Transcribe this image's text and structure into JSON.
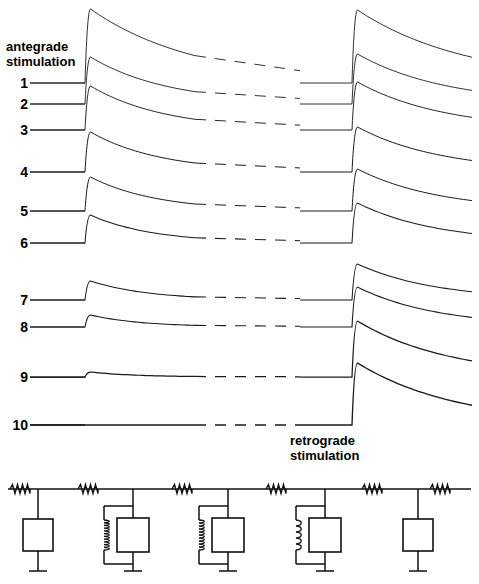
{
  "figure": {
    "kind": "electrophysiology-recording-with-equivalent-circuit",
    "antegrade_label": "antegrade\nstimulation",
    "retrograde_label": "retrograde\nstimulation"
  },
  "chart_data": {
    "type": "line",
    "title": "",
    "xlabel": "",
    "ylabel": "",
    "grid": false,
    "legend": null,
    "annotations": [
      "antegrade stimulation",
      "retrograde stimulation"
    ],
    "x_axis": {
      "antegrade_stimulus_x": 85,
      "retrograde_stimulus_x": 352,
      "time_break_dashes": [
        195,
        300
      ],
      "trace_start_x": 30,
      "trace_end_x": 472
    },
    "categories": [
      "1",
      "2",
      "3",
      "4",
      "5",
      "6",
      "7",
      "8",
      "9",
      "10"
    ],
    "series": [
      {
        "name": "1",
        "baseline_y": 83,
        "antegrade_amplitude": 74,
        "retrograde_amplitude": 73,
        "antegrade_decay": 105,
        "retrograde_decay": 110,
        "stroke_width": 0.9
      },
      {
        "name": "2",
        "baseline_y": 104,
        "antegrade_amplitude": 47,
        "retrograde_amplitude": 50,
        "antegrade_decay": 78,
        "retrograde_decay": 88,
        "stroke_width": 0.9
      },
      {
        "name": "3",
        "baseline_y": 130,
        "antegrade_amplitude": 44,
        "retrograde_amplitude": 48,
        "antegrade_decay": 74,
        "retrograde_decay": 86,
        "stroke_width": 0.95
      },
      {
        "name": "4",
        "baseline_y": 172,
        "antegrade_amplitude": 40,
        "retrograde_amplitude": 45,
        "antegrade_decay": 70,
        "retrograde_decay": 84,
        "stroke_width": 1.0
      },
      {
        "name": "5",
        "baseline_y": 211,
        "antegrade_amplitude": 34,
        "retrograde_amplitude": 42,
        "antegrade_decay": 66,
        "retrograde_decay": 82,
        "stroke_width": 1.0
      },
      {
        "name": "6",
        "baseline_y": 243,
        "antegrade_amplitude": 28,
        "retrograde_amplitude": 40,
        "antegrade_decay": 62,
        "retrograde_decay": 80,
        "stroke_width": 1.05
      },
      {
        "name": "7",
        "baseline_y": 300,
        "antegrade_amplitude": 19,
        "retrograde_amplitude": 36,
        "antegrade_decay": 58,
        "retrograde_decay": 78,
        "stroke_width": 1.05
      },
      {
        "name": "8",
        "baseline_y": 327,
        "antegrade_amplitude": 12,
        "retrograde_amplitude": 40,
        "antegrade_decay": 52,
        "retrograde_decay": 80,
        "stroke_width": 1.1
      },
      {
        "name": "9",
        "baseline_y": 377,
        "antegrade_amplitude": 5,
        "retrograde_amplitude": 56,
        "antegrade_decay": 46,
        "retrograde_decay": 92,
        "stroke_width": 1.25
      },
      {
        "name": "10",
        "baseline_y": 425,
        "antegrade_amplitude": 0,
        "retrograde_amplitude": 62,
        "antegrade_decay": 40,
        "retrograde_decay": 100,
        "stroke_width": 1.35
      }
    ]
  },
  "trace_labels": [
    {
      "number": "1",
      "y": 83
    },
    {
      "number": "2",
      "y": 104
    },
    {
      "number": "3",
      "y": 130
    },
    {
      "number": "4",
      "y": 172
    },
    {
      "number": "5",
      "y": 211
    },
    {
      "number": "6",
      "y": 243
    },
    {
      "number": "7",
      "y": 300
    },
    {
      "number": "8",
      "y": 327
    },
    {
      "number": "9",
      "y": 377
    },
    {
      "number": "10",
      "y": 425
    }
  ],
  "circuit": {
    "rail_y": 489,
    "ground_y": 575,
    "branches": [
      {
        "x": 38,
        "type": "box-only",
        "box": {
          "w": 30,
          "h": 32,
          "cy": 535
        }
      },
      {
        "x": 133,
        "type": "coil-parallel-box",
        "box": {
          "w": 32,
          "h": 34,
          "cy": 535
        },
        "coil_x": 104,
        "coil_turns": 11
      },
      {
        "x": 228,
        "type": "coil-parallel-box",
        "box": {
          "w": 32,
          "h": 34,
          "cy": 535
        },
        "coil_x": 199,
        "coil_turns": 10
      },
      {
        "x": 325,
        "type": "coil-parallel-box",
        "box": {
          "w": 32,
          "h": 34,
          "cy": 535
        },
        "coil_x": 296,
        "coil_turns": 5
      },
      {
        "x": 418,
        "type": "box-only",
        "box": {
          "w": 30,
          "h": 32,
          "cy": 535
        }
      }
    ],
    "series_resistors_x": [
      20,
      88,
      182,
      276,
      372,
      440
    ]
  }
}
